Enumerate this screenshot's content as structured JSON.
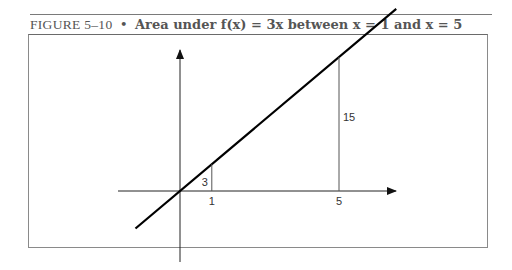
{
  "caption": {
    "figure_label": "FIGURE 5–10",
    "separator": "•",
    "title": "Area under f(x) = 3x between x = 1 and x = 5"
  },
  "chart_data": {
    "type": "line",
    "title": "Area under f(x) = 3x between x = 1 and x = 5",
    "function": "f(x) = 3x",
    "slope": 3,
    "intercept": 0,
    "x_range": [
      -1.4,
      6.8
    ],
    "xlabel": "",
    "ylabel": "",
    "grid": false,
    "bounds": [
      {
        "x": 1,
        "y": 3,
        "x_label": "1",
        "height_label": "3"
      },
      {
        "x": 5,
        "y": 15,
        "x_label": "5",
        "height_label": "15"
      }
    ]
  }
}
